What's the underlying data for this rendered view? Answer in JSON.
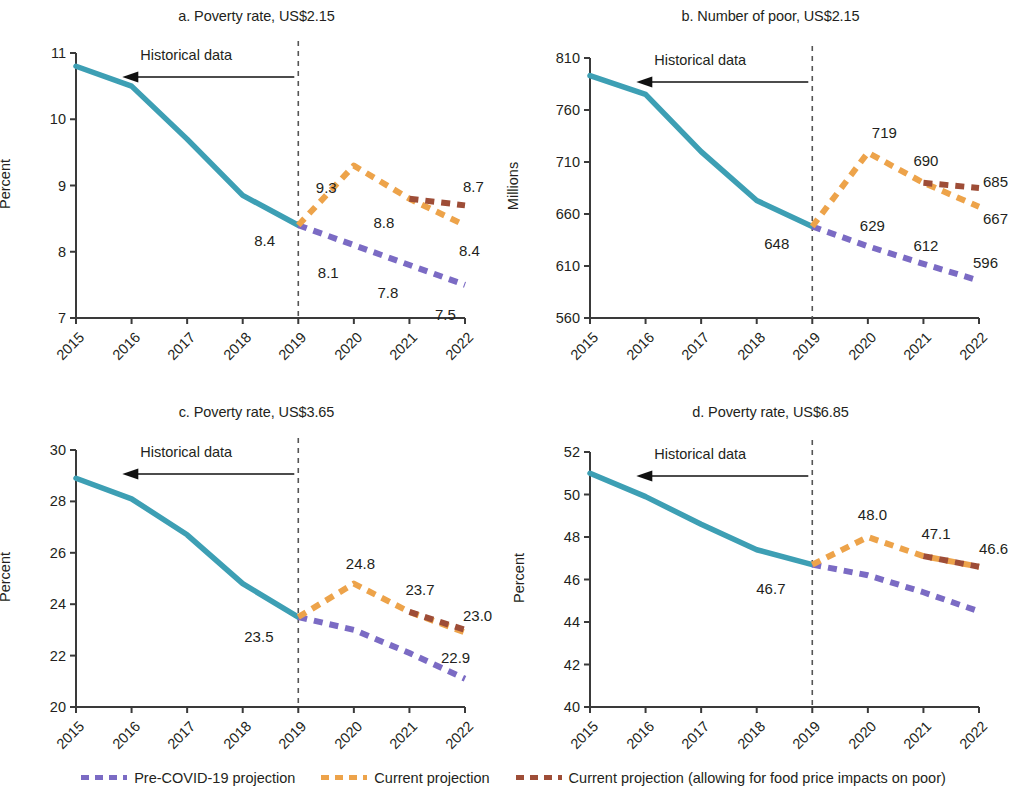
{
  "colors": {
    "historical": "#3d9fb4",
    "pre_covid": "#7b6bc4",
    "current": "#eda34a",
    "current_food": "#9e4d37",
    "axis": "#3a3a3a",
    "text": "#231f20"
  },
  "legend": {
    "items": [
      {
        "label": "Pre-COVID-19 projection",
        "color_key": "pre_covid"
      },
      {
        "label": "Current projection",
        "color_key": "current"
      },
      {
        "label": "Current projection (allowing for food price impacts on poor)",
        "color_key": "current_food"
      }
    ]
  },
  "annotation": {
    "historical_data": "Historical data"
  },
  "chart_data": [
    {
      "id": "a",
      "type": "line",
      "title": "a. Poverty rate, US$2.15",
      "xlabel": "",
      "ylabel": "Percent",
      "x": [
        "2015",
        "2016",
        "2017",
        "2018",
        "2019",
        "2020",
        "2021",
        "2022"
      ],
      "ylim": [
        7,
        11
      ],
      "yticks": [
        "7",
        "8",
        "9",
        "10",
        "11"
      ],
      "ytick_values": [
        7,
        8,
        9,
        10,
        11
      ],
      "grid": false,
      "legend_position": "bottom",
      "divider_x": "2019",
      "series": [
        {
          "name": "Historical data",
          "color_key": "historical",
          "style": "solid",
          "x": [
            "2015",
            "2016",
            "2017",
            "2018",
            "2019"
          ],
          "values": [
            10.8,
            10.5,
            9.7,
            8.85,
            8.4
          ]
        },
        {
          "name": "Pre-COVID-19 projection",
          "color_key": "pre_covid",
          "style": "dashed",
          "x": [
            "2019",
            "2020",
            "2021",
            "2022"
          ],
          "values": [
            8.4,
            8.1,
            7.8,
            7.5
          ]
        },
        {
          "name": "Current projection",
          "color_key": "current",
          "style": "dashed",
          "x": [
            "2019",
            "2020",
            "2021",
            "2022"
          ],
          "values": [
            8.4,
            9.3,
            8.8,
            8.4
          ]
        },
        {
          "name": "Current projection (allowing for food price impacts on poor)",
          "color_key": "current_food",
          "style": "dashed",
          "x": [
            "2021",
            "2022"
          ],
          "values": [
            8.8,
            8.7
          ]
        }
      ],
      "point_labels": [
        {
          "text": "8.4",
          "x": "2019",
          "y": 8.4,
          "dx": -44,
          "dy": 16,
          "series": "historical"
        },
        {
          "text": "9.3",
          "x": "2020",
          "y": 9.3,
          "dx": -38,
          "dy": 22,
          "series": "current"
        },
        {
          "text": "8.8",
          "x": "2021",
          "y": 8.8,
          "dx": -36,
          "dy": 24,
          "series": "current"
        },
        {
          "text": "8.4",
          "x": "2022",
          "y": 8.4,
          "dx": -6,
          "dy": 26,
          "series": "current"
        },
        {
          "text": "8.7",
          "x": "2022",
          "y": 8.7,
          "dx": -2,
          "dy": -18,
          "series": "current_food"
        },
        {
          "text": "8.1",
          "x": "2020",
          "y": 8.1,
          "dx": -36,
          "dy": 28,
          "series": "pre_covid"
        },
        {
          "text": "7.8",
          "x": "2021",
          "y": 7.8,
          "dx": -32,
          "dy": 28,
          "series": "pre_covid"
        },
        {
          "text": "7.5",
          "x": "2022",
          "y": 7.5,
          "dx": -30,
          "dy": 30,
          "series": "pre_covid"
        }
      ]
    },
    {
      "id": "b",
      "type": "line",
      "title": "b. Number of poor, US$2.15",
      "xlabel": "",
      "ylabel": "Millions",
      "x": [
        "2015",
        "2016",
        "2017",
        "2018",
        "2019",
        "2020",
        "2021",
        "2022"
      ],
      "ylim": [
        560,
        810
      ],
      "yticks": [
        "560",
        "610",
        "660",
        "710",
        "760",
        "810"
      ],
      "ytick_values": [
        560,
        610,
        660,
        710,
        760,
        810
      ],
      "grid": false,
      "legend_position": "bottom",
      "divider_x": "2019",
      "series": [
        {
          "name": "Historical data",
          "color_key": "historical",
          "style": "solid",
          "x": [
            "2015",
            "2016",
            "2017",
            "2018",
            "2019"
          ],
          "values": [
            793,
            775,
            720,
            673,
            648
          ]
        },
        {
          "name": "Pre-COVID-19 projection",
          "color_key": "pre_covid",
          "style": "dashed",
          "x": [
            "2019",
            "2020",
            "2021",
            "2022"
          ],
          "values": [
            648,
            629,
            612,
            596
          ]
        },
        {
          "name": "Current projection",
          "color_key": "current",
          "style": "dashed",
          "x": [
            "2019",
            "2020",
            "2021",
            "2022"
          ],
          "values": [
            648,
            719,
            690,
            667
          ]
        },
        {
          "name": "Current projection (allowing for food price impacts on poor)",
          "color_key": "current_food",
          "style": "dashed",
          "x": [
            "2021",
            "2022"
          ],
          "values": [
            690,
            685
          ]
        }
      ],
      "point_labels": [
        {
          "text": "648",
          "x": "2019",
          "y": 648,
          "dx": -48,
          "dy": 18,
          "series": "historical"
        },
        {
          "text": "719",
          "x": "2020",
          "y": 719,
          "dx": 4,
          "dy": -20,
          "series": "current"
        },
        {
          "text": "690",
          "x": "2021",
          "y": 690,
          "dx": -10,
          "dy": -22,
          "series": "current"
        },
        {
          "text": "667",
          "x": "2022",
          "y": 667,
          "dx": 4,
          "dy": 12,
          "series": "current"
        },
        {
          "text": "685",
          "x": "2022",
          "y": 685,
          "dx": 4,
          "dy": -6,
          "series": "current_food"
        },
        {
          "text": "629",
          "x": "2020",
          "y": 629,
          "dx": -8,
          "dy": -20,
          "series": "pre_covid"
        },
        {
          "text": "612",
          "x": "2021",
          "y": 612,
          "dx": -10,
          "dy": -18,
          "series": "pre_covid"
        },
        {
          "text": "596",
          "x": "2022",
          "y": 596,
          "dx": -6,
          "dy": -18,
          "series": "pre_covid"
        }
      ]
    },
    {
      "id": "c",
      "type": "line",
      "title": "c. Poverty rate, US$3.65",
      "xlabel": "",
      "ylabel": "Percent",
      "x": [
        "2015",
        "2016",
        "2017",
        "2018",
        "2019",
        "2020",
        "2021",
        "2022"
      ],
      "ylim": [
        20,
        30
      ],
      "yticks": [
        "20",
        "22",
        "24",
        "26",
        "28",
        "30"
      ],
      "ytick_values": [
        20,
        22,
        24,
        26,
        28,
        30
      ],
      "grid": false,
      "legend_position": "bottom",
      "divider_x": "2019",
      "series": [
        {
          "name": "Historical data",
          "color_key": "historical",
          "style": "solid",
          "x": [
            "2015",
            "2016",
            "2017",
            "2018",
            "2019"
          ],
          "values": [
            28.9,
            28.1,
            26.7,
            24.8,
            23.5
          ]
        },
        {
          "name": "Pre-COVID-19 projection",
          "color_key": "pre_covid",
          "style": "dashed",
          "x": [
            "2019",
            "2020",
            "2021",
            "2022"
          ],
          "values": [
            23.5,
            23.0,
            22.1,
            21.1
          ]
        },
        {
          "name": "Current projection",
          "color_key": "current",
          "style": "dashed",
          "x": [
            "2019",
            "2020",
            "2021",
            "2022"
          ],
          "values": [
            23.5,
            24.8,
            23.7,
            22.9
          ]
        },
        {
          "name": "Current projection (allowing for food price impacts on poor)",
          "color_key": "current_food",
          "style": "dashed",
          "x": [
            "2021",
            "2022"
          ],
          "values": [
            23.7,
            23.0
          ]
        }
      ],
      "point_labels": [
        {
          "text": "23.5",
          "x": "2019",
          "y": 23.5,
          "dx": -54,
          "dy": 20,
          "series": "historical"
        },
        {
          "text": "24.8",
          "x": "2020",
          "y": 24.8,
          "dx": -8,
          "dy": -20,
          "series": "current"
        },
        {
          "text": "23.7",
          "x": "2021",
          "y": 23.7,
          "dx": -4,
          "dy": -22,
          "series": "current"
        },
        {
          "text": "22.9",
          "x": "2022",
          "y": 22.9,
          "dx": -24,
          "dy": 26,
          "series": "current"
        },
        {
          "text": "23.0",
          "x": "2022",
          "y": 23.0,
          "dx": -2,
          "dy": -14,
          "series": "current_food"
        }
      ]
    },
    {
      "id": "d",
      "type": "line",
      "title": "d. Poverty rate, US$6.85",
      "xlabel": "",
      "ylabel": "Percent",
      "x": [
        "2015",
        "2016",
        "2017",
        "2018",
        "2019",
        "2020",
        "2021",
        "2022"
      ],
      "ylim": [
        40,
        52
      ],
      "yticks": [
        "40",
        "42",
        "44",
        "46",
        "48",
        "50",
        "52"
      ],
      "ytick_values": [
        40,
        42,
        44,
        46,
        48,
        50,
        52
      ],
      "grid": false,
      "legend_position": "bottom",
      "divider_x": "2019",
      "series": [
        {
          "name": "Historical data",
          "color_key": "historical",
          "style": "solid",
          "x": [
            "2015",
            "2016",
            "2017",
            "2018",
            "2019"
          ],
          "values": [
            51.0,
            49.9,
            48.6,
            47.4,
            46.7
          ]
        },
        {
          "name": "Pre-COVID-19 projection",
          "color_key": "pre_covid",
          "style": "dashed",
          "x": [
            "2019",
            "2020",
            "2021",
            "2022"
          ],
          "values": [
            46.7,
            46.2,
            45.4,
            44.5
          ]
        },
        {
          "name": "Current projection",
          "color_key": "current",
          "style": "dashed",
          "x": [
            "2019",
            "2020",
            "2021",
            "2022"
          ],
          "values": [
            46.7,
            48.0,
            47.1,
            46.6
          ]
        },
        {
          "name": "Current projection (allowing for food price impacts on poor)",
          "color_key": "current_food",
          "style": "dashed",
          "x": [
            "2021",
            "2022"
          ],
          "values": [
            47.1,
            46.6
          ]
        }
      ],
      "point_labels": [
        {
          "text": "46.7",
          "x": "2019",
          "y": 46.7,
          "dx": -56,
          "dy": 24,
          "series": "historical"
        },
        {
          "text": "48.0",
          "x": "2020",
          "y": 48.0,
          "dx": -10,
          "dy": -22,
          "series": "current"
        },
        {
          "text": "47.1",
          "x": "2021",
          "y": 47.1,
          "dx": -2,
          "dy": -22,
          "series": "current"
        },
        {
          "text": "46.6",
          "x": "2022",
          "y": 46.6,
          "dx": 0,
          "dy": -18,
          "series": "current"
        }
      ]
    }
  ]
}
